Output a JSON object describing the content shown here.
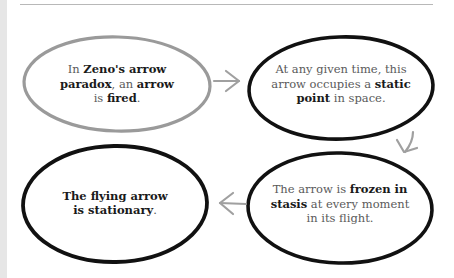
{
  "diagram": {
    "colors": {
      "outline_first": "#9a9a9a",
      "outline_rest": "#111111",
      "arrow": "#a0a0a0",
      "text_regular": "#5a5a5a",
      "text_bold": "#1a1a1a",
      "rule": "#b8b8b8",
      "left_strip": "#e6e6e6"
    },
    "nodes": [
      {
        "id": "step-1",
        "outline": "gray",
        "segments": [
          {
            "t": "In ",
            "b": false
          },
          {
            "t": "Zeno's arrow paradox",
            "b": true
          },
          {
            "t": ", an ",
            "b": false
          },
          {
            "t": "arrow",
            "b": true
          },
          {
            "t": " is ",
            "b": false
          },
          {
            "t": "fired",
            "b": true
          },
          {
            "t": ".",
            "b": false
          }
        ],
        "lines": [
          "In Zeno's arrow",
          "paradox, an arrow",
          "is fired."
        ]
      },
      {
        "id": "step-2",
        "outline": "black",
        "lines": [
          "At any given time, this",
          "arrow occupies a static",
          "point in space."
        ]
      },
      {
        "id": "step-3",
        "outline": "black",
        "lines": [
          "The arrow is frozen in",
          "stasis at every moment",
          "in its flight."
        ]
      },
      {
        "id": "step-4",
        "outline": "black",
        "lines": [
          "The flying arrow",
          "is stationary."
        ]
      }
    ],
    "text": {
      "n1_a": "In ",
      "n1_b": "Zeno's arrow",
      "n1_c": "paradox",
      "n1_d": ", an ",
      "n1_e": "arrow",
      "n1_f": "is ",
      "n1_g": "fired",
      "n1_h": ".",
      "n2_a": "At any given time, this",
      "n2_b": "arrow occupies a ",
      "n2_c": "static",
      "n2_d": "point",
      "n2_e": " in space.",
      "n3_a": "The arrow is ",
      "n3_b": "frozen in",
      "n3_c": "stasis",
      "n3_d": " at every moment",
      "n3_e": "in its flight.",
      "n4_a": "The flying arrow",
      "n4_b": "is stationary",
      "n4_c": "."
    },
    "edges": [
      {
        "from": "step-1",
        "to": "step-2",
        "direction": "right"
      },
      {
        "from": "step-2",
        "to": "step-3",
        "direction": "down"
      },
      {
        "from": "step-3",
        "to": "step-4",
        "direction": "left"
      }
    ]
  }
}
